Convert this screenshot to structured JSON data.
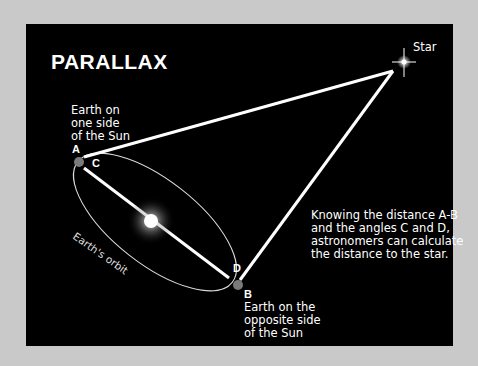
{
  "diagram": {
    "title": "PARALLAX",
    "star_label": "Star",
    "point_a": {
      "label": "A",
      "caption_lines": [
        "Earth on",
        "one side",
        "of the Sun"
      ]
    },
    "point_b": {
      "label": "B",
      "caption_lines": [
        "Earth on the",
        "opposite side",
        "of the Sun"
      ]
    },
    "angle_c": "C",
    "angle_d": "D",
    "orbit_label": "Earth's orbit",
    "explanation_lines": [
      "Knowing the distance A-B",
      "and the angles C and D,",
      "astronomers can calculate",
      "the distance to the star."
    ],
    "colors": {
      "background": "#000000",
      "frame": "#c9c9c9",
      "lines": "#ffffff",
      "earth": "#7a7a7a"
    }
  }
}
